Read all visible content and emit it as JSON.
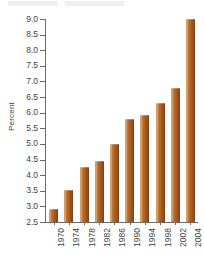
{
  "chart_data": {
    "type": "bar",
    "title": "",
    "xlabel": "",
    "ylabel": "Percent",
    "categories": [
      "1970",
      "1974",
      "1978",
      "1982",
      "1986",
      "1990",
      "1994",
      "1998",
      "2002",
      "2004"
    ],
    "values": [
      2.92,
      3.53,
      4.25,
      4.44,
      5.0,
      5.8,
      5.92,
      6.3,
      6.8,
      9.0
    ],
    "ylim": [
      2.5,
      9.0
    ],
    "ytick_labels": [
      "2.5",
      "3.0",
      "3.5",
      "4.0",
      "4.5",
      "5.0",
      "5.5",
      "6.0",
      "6.5",
      "7.0",
      "7.5",
      "8.0",
      "8.5",
      "9.0"
    ],
    "ytick_values": [
      2.5,
      3.0,
      3.5,
      4.0,
      4.5,
      5.0,
      5.5,
      6.0,
      6.5,
      7.0,
      7.5,
      8.0,
      8.5,
      9.0
    ],
    "grid": false,
    "legend": false,
    "bar_color": "#a85c23",
    "axis_color": "#6b6b6b",
    "text_color": "#3f3f3f",
    "background": "#ffffff"
  }
}
